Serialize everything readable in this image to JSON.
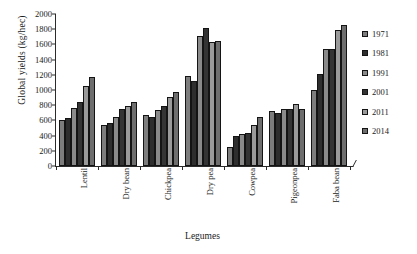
{
  "chart_data": {
    "type": "bar",
    "title": "",
    "xlabel": "Legumes",
    "ylabel": "Global yields (kg/hec)",
    "ylim": [
      0,
      2000
    ],
    "ytick_step": 200,
    "yticks": [
      "0",
      "200",
      "400",
      "600",
      "800",
      "1000",
      "1200",
      "1400",
      "1600",
      "1800",
      "2000"
    ],
    "grid": false,
    "legend_position": "right",
    "categories": [
      "Lentil",
      "Dry bean",
      "Chickpea",
      "Dry pea",
      "Cowpea",
      "Pigeonpea",
      "Faba bean"
    ],
    "series": [
      {
        "name": "1971",
        "color": "#7d7d7d",
        "values": [
          610,
          545,
          670,
          1190,
          255,
          720,
          1000
        ]
      },
      {
        "name": "1981",
        "color": "#2e2e2e",
        "values": [
          630,
          560,
          650,
          1125,
          400,
          700,
          1210
        ]
      },
      {
        "name": "1991",
        "color": "#8a8a8a",
        "values": [
          760,
          640,
          735,
          1715,
          420,
          745,
          1545
        ]
      },
      {
        "name": "2001",
        "color": "#343434",
        "values": [
          840,
          755,
          790,
          1810,
          440,
          755,
          1545
        ]
      },
      {
        "name": "2011",
        "color": "#9a9a9a",
        "values": [
          1050,
          790,
          905,
          1630,
          545,
          810,
          1790
        ]
      },
      {
        "name": "2014",
        "color": "#6e6e6e",
        "values": [
          1165,
          840,
          980,
          1645,
          640,
          745,
          1850
        ]
      }
    ]
  },
  "legend": {
    "items": [
      "1971",
      "1981",
      "1991",
      "2001",
      "2011",
      "2014"
    ]
  },
  "axes": {
    "y_title": "Global yields (kg/hec)",
    "x_title": "Legumes"
  }
}
